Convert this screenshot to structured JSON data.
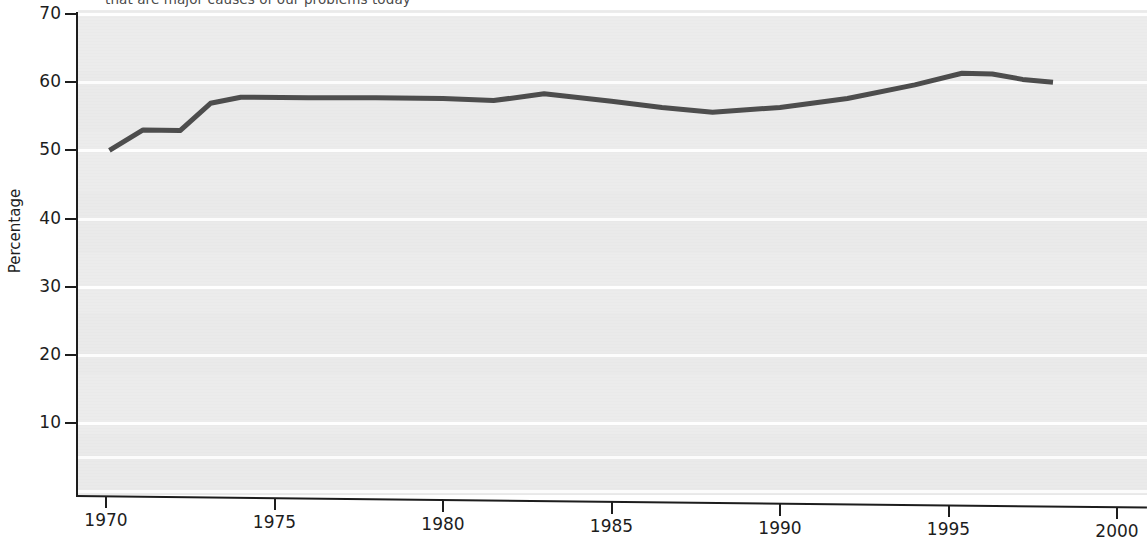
{
  "chart_data": {
    "type": "line",
    "title": "that are major causes of our problems today",
    "xlabel": "",
    "ylabel": "Percentage",
    "xlim": [
      1970,
      2000
    ],
    "ylim": [
      0,
      70
    ],
    "grid": true,
    "legend": "none",
    "line_color": "#4d4d4d",
    "plot_background": "#ececec",
    "gridline_color": "#ffffff",
    "x_ticks": [
      "1970",
      "1975",
      "1980",
      "1985",
      "1990",
      "1995",
      "2000"
    ],
    "x_tick_values": [
      1970,
      1975,
      1980,
      1985,
      1990,
      1995,
      2000
    ],
    "y_ticks": [
      "10",
      "20",
      "30",
      "40",
      "50",
      "60",
      "70"
    ],
    "y_tick_values": [
      10,
      20,
      30,
      40,
      50,
      60,
      70
    ],
    "series": [
      {
        "name": "Percentage",
        "x": [
          1970.1,
          1971.1,
          1972.2,
          1973.1,
          1974.0,
          1976.0,
          1978.0,
          1980.0,
          1981.5,
          1983.0,
          1985.0,
          1986.5,
          1988.0,
          1990.0,
          1992.0,
          1994.0,
          1995.4,
          1996.3,
          1997.2,
          1998.1
        ],
        "values": [
          50.0,
          53.0,
          52.9,
          56.9,
          57.8,
          57.7,
          57.7,
          57.6,
          57.3,
          58.3,
          57.2,
          56.3,
          55.6,
          56.3,
          57.6,
          59.6,
          61.3,
          61.2,
          60.4,
          60.0
        ]
      }
    ]
  }
}
